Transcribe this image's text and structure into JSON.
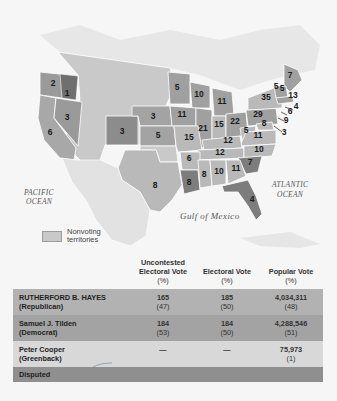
{
  "map": {
    "labels": {
      "pacific": [
        "PACIFIC",
        "OCEAN"
      ],
      "atlantic": [
        "ATLANTIC",
        "OCEAN"
      ],
      "gulf": "Gulf of Mexico"
    },
    "legend": {
      "swatch_label": "Nonvoting territories",
      "swatch_color": "#c9c9c9"
    },
    "state_votes": [
      {
        "state": "Oregon",
        "votes": "1",
        "x": 67,
        "y": 96
      },
      {
        "state": "Oregon-west",
        "votes": "2",
        "x": 53,
        "y": 86
      },
      {
        "state": "Nevada",
        "votes": "3",
        "x": 67,
        "y": 120
      },
      {
        "state": "California",
        "votes": "6",
        "x": 50,
        "y": 135
      },
      {
        "state": "Colorado",
        "votes": "3",
        "x": 122,
        "y": 134
      },
      {
        "state": "Nebraska",
        "votes": "3",
        "x": 153,
        "y": 119
      },
      {
        "state": "Kansas",
        "votes": "5",
        "x": 158,
        "y": 138
      },
      {
        "state": "Minnesota",
        "votes": "5",
        "x": 177,
        "y": 90
      },
      {
        "state": "Wisconsin",
        "votes": "10",
        "x": 199,
        "y": 97
      },
      {
        "state": "Michigan",
        "votes": "11",
        "x": 222,
        "y": 104
      },
      {
        "state": "Iowa",
        "votes": "11",
        "x": 182,
        "y": 117
      },
      {
        "state": "Illinois",
        "votes": "21",
        "x": 203,
        "y": 131
      },
      {
        "state": "Indiana",
        "votes": "15",
        "x": 219,
        "y": 127
      },
      {
        "state": "Ohio",
        "votes": "22",
        "x": 235,
        "y": 124
      },
      {
        "state": "Missouri",
        "votes": "15",
        "x": 189,
        "y": 140
      },
      {
        "state": "Pennsylvania",
        "votes": "29",
        "x": 258,
        "y": 117
      },
      {
        "state": "New York",
        "votes": "35",
        "x": 266,
        "y": 100
      },
      {
        "state": "Maine",
        "votes": "7",
        "x": 290,
        "y": 78
      },
      {
        "state": "Vermont",
        "votes": "5",
        "x": 276,
        "y": 89
      },
      {
        "state": "New Hampshire",
        "votes": "5",
        "x": 282,
        "y": 91
      },
      {
        "state": "Massachusetts",
        "votes": "13",
        "x": 293,
        "y": 98
      },
      {
        "state": "Rhode Island",
        "votes": "4",
        "x": 296,
        "y": 109
      },
      {
        "state": "Connecticut",
        "votes": "6",
        "x": 290,
        "y": 114
      },
      {
        "state": "New Jersey",
        "votes": "9",
        "x": 286,
        "y": 123
      },
      {
        "state": "Delaware",
        "votes": "3",
        "x": 284,
        "y": 135
      },
      {
        "state": "Maryland",
        "votes": "8",
        "x": 264,
        "y": 126
      },
      {
        "state": "West Virginia",
        "votes": "5",
        "x": 246,
        "y": 133
      },
      {
        "state": "Virginia",
        "votes": "11",
        "x": 258,
        "y": 138
      },
      {
        "state": "Kentucky",
        "votes": "12",
        "x": 228,
        "y": 143
      },
      {
        "state": "Tennessee",
        "votes": "12",
        "x": 220,
        "y": 155
      },
      {
        "state": "North Carolina",
        "votes": "10",
        "x": 259,
        "y": 152
      },
      {
        "state": "South Carolina",
        "votes": "7",
        "x": 250,
        "y": 165
      },
      {
        "state": "Arkansas",
        "votes": "6",
        "x": 189,
        "y": 161
      },
      {
        "state": "Mississippi",
        "votes": "8",
        "x": 204,
        "y": 177
      },
      {
        "state": "Alabama",
        "votes": "10",
        "x": 219,
        "y": 174
      },
      {
        "state": "Georgia",
        "votes": "11",
        "x": 236,
        "y": 171
      },
      {
        "state": "Louisiana",
        "votes": "8",
        "x": 189,
        "y": 185
      },
      {
        "state": "Florida",
        "votes": "4",
        "x": 252,
        "y": 202
      },
      {
        "state": "Texas",
        "votes": "8",
        "x": 155,
        "y": 188
      }
    ]
  },
  "table": {
    "headers": {
      "candidate": "",
      "uncontested": [
        "Uncontested",
        "Electoral Vote",
        "(%)"
      ],
      "electoral": [
        "Electoral Vote",
        "(%)"
      ],
      "popular": [
        "Popular Vote",
        "(%)"
      ]
    },
    "rows": [
      {
        "name": "RUTHERFORD B. HAYES",
        "party": "(Republican)",
        "uncontested": "165",
        "uncontested_pct": "(47)",
        "electoral": "185",
        "electoral_pct": "(50)",
        "popular": "4,034,311",
        "popular_pct": "(48)"
      },
      {
        "name": "Samuel J. Tilden",
        "party": "(Democrat)",
        "uncontested": "184",
        "uncontested_pct": "(53)",
        "electoral": "184",
        "electoral_pct": "(50)",
        "popular": "4,288,546",
        "popular_pct": "(51)"
      },
      {
        "name": "Peter Cooper",
        "party": "(Greenback)",
        "uncontested": "—",
        "uncontested_pct": "",
        "electoral": "—",
        "electoral_pct": "",
        "popular": "75,973",
        "popular_pct": "(1)"
      },
      {
        "name": "Disputed",
        "party": "",
        "uncontested": "",
        "uncontested_pct": "",
        "electoral": "",
        "electoral_pct": "",
        "popular": "",
        "popular_pct": ""
      }
    ]
  },
  "colors": {
    "hayes_row": "#b2b2b2",
    "tilden_row": "#a3a3a3",
    "cooper_row": "#d8d8d8",
    "disputed_row": "#8f8f8f",
    "republican_state": "#9a9a9a",
    "democrat_state": "#b9b9b9",
    "disputed_state": "#7d7d7d"
  }
}
